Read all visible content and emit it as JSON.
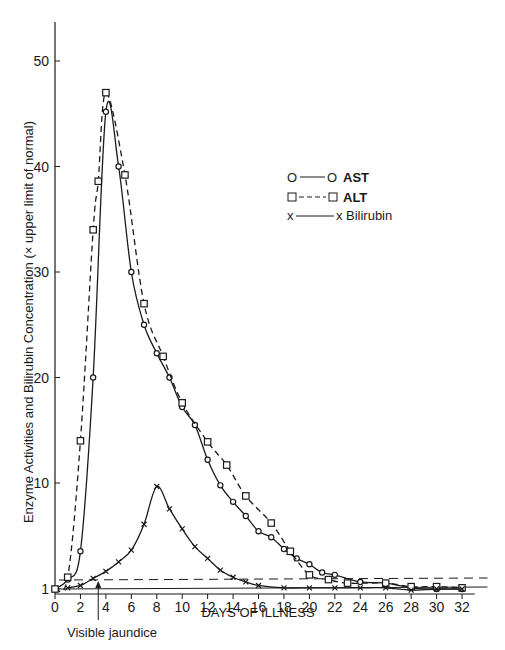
{
  "chart_data": {
    "type": "line",
    "title": "",
    "xlabel": "DAYS OF ILLNESS",
    "ylabel": "Enzyme Activities and Bilirubin Concentration (× upper limit of normal)",
    "xlim": [
      0,
      33
    ],
    "ylim": [
      1,
      53
    ],
    "x_ticks": [
      0,
      2,
      4,
      6,
      8,
      10,
      12,
      14,
      16,
      18,
      20,
      22,
      24,
      26,
      28,
      30,
      32
    ],
    "y_ticks": [
      1,
      10,
      20,
      30,
      40,
      50
    ],
    "grid": false,
    "legend_position": "upper-right",
    "legend": [
      {
        "name": "AST",
        "marker": "circle",
        "line": "solid",
        "bold": true
      },
      {
        "name": "ALT",
        "marker": "square",
        "line": "dashed",
        "bold": true
      },
      {
        "name": "Bilirubin",
        "marker": "x",
        "line": "solid",
        "bold": false
      }
    ],
    "annotations": [
      {
        "text": "Visible jaundice",
        "x": 3.4
      },
      {
        "text": "upper limit of normal (dashed reference)",
        "y": 1.6
      }
    ],
    "series": [
      {
        "name": "AST",
        "style": "solid",
        "marker": "circle",
        "points": [
          [
            0,
            1
          ],
          [
            1,
            1.8
          ],
          [
            2,
            4.2
          ],
          [
            3,
            20
          ],
          [
            4,
            45.2
          ],
          [
            5,
            40
          ],
          [
            6,
            30
          ],
          [
            7,
            25
          ],
          [
            8,
            22.3
          ],
          [
            9,
            20
          ],
          [
            10,
            17.2
          ],
          [
            11,
            15.5
          ],
          [
            12,
            12.2
          ],
          [
            13,
            9.8
          ],
          [
            14,
            8.4
          ],
          [
            15,
            7.2
          ],
          [
            16,
            5.9
          ],
          [
            17,
            5.4
          ],
          [
            18,
            4.4
          ],
          [
            19,
            3.6
          ],
          [
            20,
            3.1
          ],
          [
            21,
            2.4
          ],
          [
            22,
            2.2
          ],
          [
            24,
            1.6
          ],
          [
            26,
            1.5
          ],
          [
            28,
            1.1
          ],
          [
            30,
            1.0
          ],
          [
            32,
            1.0
          ]
        ]
      },
      {
        "name": "ALT",
        "style": "dashed",
        "marker": "square",
        "points": [
          [
            0,
            1
          ],
          [
            1,
            2
          ],
          [
            2,
            14
          ],
          [
            3,
            34
          ],
          [
            3.4,
            38.6
          ],
          [
            4,
            47
          ],
          [
            5.5,
            39.2
          ],
          [
            7,
            27
          ],
          [
            8.5,
            22
          ],
          [
            10,
            17.6
          ],
          [
            12,
            13.9
          ],
          [
            13.5,
            11.7
          ],
          [
            15,
            8.9
          ],
          [
            17,
            6.6
          ],
          [
            18.5,
            4.2
          ],
          [
            20,
            2.2
          ],
          [
            21.5,
            1.8
          ],
          [
            23,
            1.5
          ],
          [
            26,
            1.5
          ],
          [
            28,
            1.2
          ],
          [
            30,
            1.2
          ],
          [
            32,
            1.1
          ]
        ]
      },
      {
        "name": "Bilirubin",
        "style": "solid",
        "marker": "x",
        "points": [
          [
            1,
            1.1
          ],
          [
            2,
            1.3
          ],
          [
            3,
            1.9
          ],
          [
            4,
            2.5
          ],
          [
            5,
            3.3
          ],
          [
            6,
            4.3
          ],
          [
            7,
            6.5
          ],
          [
            8,
            9.7
          ],
          [
            9,
            7.8
          ],
          [
            10,
            6.1
          ],
          [
            11,
            4.6
          ],
          [
            12,
            3.6
          ],
          [
            13,
            2.6
          ],
          [
            14,
            2.0
          ],
          [
            15,
            1.6
          ],
          [
            16,
            1.3
          ],
          [
            18,
            1.1
          ],
          [
            20,
            1.1
          ],
          [
            22,
            1.1
          ],
          [
            24,
            1.1
          ],
          [
            26,
            1.1
          ],
          [
            28,
            0.9
          ],
          [
            30,
            1.0
          ],
          [
            32,
            1.0
          ]
        ]
      }
    ]
  },
  "labels": {
    "x_axis_title": "DAYS OF ILLNESS",
    "y_axis_title": "Enzyme Activities and Bilirubin Concentration (× upper limit of normal)",
    "annotation_jaundice": "Visible jaundice",
    "legend_ast": "AST",
    "legend_alt": "ALT",
    "legend_bili": "Bilirubin"
  }
}
